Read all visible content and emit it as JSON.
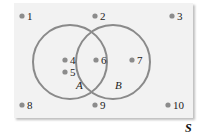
{
  "diagram": {
    "type": "venn",
    "universe_label": "S",
    "colors": {
      "background": "#f2f2f2",
      "circle_stroke": "#8a8a8a",
      "point_fill": "#8c8c8c",
      "text": "#222222"
    },
    "sets": [
      {
        "label": "A",
        "elements": [
          "4",
          "5",
          "6"
        ]
      },
      {
        "label": "B",
        "elements": [
          "6",
          "7"
        ]
      }
    ],
    "points": [
      {
        "label": "1",
        "x": 22,
        "y": 16
      },
      {
        "label": "2",
        "x": 95,
        "y": 16
      },
      {
        "label": "3",
        "x": 172,
        "y": 16
      },
      {
        "label": "4",
        "x": 65,
        "y": 60
      },
      {
        "label": "5",
        "x": 65,
        "y": 72
      },
      {
        "label": "6",
        "x": 96,
        "y": 60
      },
      {
        "label": "7",
        "x": 132,
        "y": 60
      },
      {
        "label": "8",
        "x": 22,
        "y": 105
      },
      {
        "label": "9",
        "x": 95,
        "y": 105
      },
      {
        "label": "10",
        "x": 168,
        "y": 105
      }
    ]
  }
}
